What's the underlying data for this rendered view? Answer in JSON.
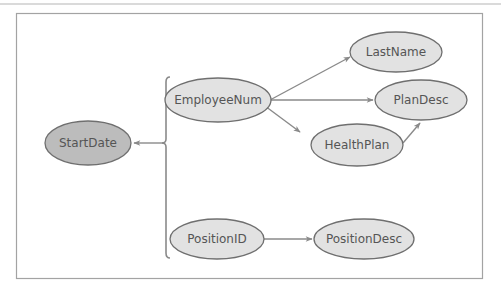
{
  "diagram": {
    "type": "functional-dependency-diagram",
    "colors": {
      "frame": "#9a9a9a",
      "node_fill": "#e2e2e2",
      "node_fill_root": "#bcbcbc",
      "node_stroke": "#6f6f6f",
      "edge": "#8a8a8a",
      "text": "#555555"
    },
    "nodes": [
      {
        "id": "startdate",
        "label": "StartDate",
        "cx": 88,
        "cy": 143,
        "rx": 43,
        "ry": 22,
        "root": true
      },
      {
        "id": "employeenum",
        "label": "EmployeeNum",
        "cx": 218,
        "cy": 100,
        "rx": 53,
        "ry": 22,
        "root": false
      },
      {
        "id": "lastname",
        "label": "LastName",
        "cx": 396,
        "cy": 52,
        "rx": 46,
        "ry": 20,
        "root": false
      },
      {
        "id": "plandesc",
        "label": "PlanDesc",
        "cx": 421,
        "cy": 100,
        "rx": 46,
        "ry": 20,
        "root": false
      },
      {
        "id": "healthplan",
        "label": "HealthPlan",
        "cx": 357,
        "cy": 145,
        "rx": 46,
        "ry": 21,
        "root": false
      },
      {
        "id": "positionid",
        "label": "PositionID",
        "cx": 217,
        "cy": 239,
        "rx": 47,
        "ry": 20,
        "root": false
      },
      {
        "id": "positiondesc",
        "label": "PositionDesc",
        "cx": 364,
        "cy": 239,
        "rx": 50,
        "ry": 20,
        "root": false
      }
    ],
    "edges": [
      {
        "from": "EmployeeNum",
        "to": "LastName"
      },
      {
        "from": "EmployeeNum",
        "to": "PlanDesc"
      },
      {
        "from": "EmployeeNum",
        "to": "HealthPlan"
      },
      {
        "from": "HealthPlan",
        "to": "PlanDesc"
      },
      {
        "from": "PositionID",
        "to": "PositionDesc"
      },
      {
        "from": "[EmployeeNum, PositionID]",
        "to": "StartDate"
      }
    ],
    "bracket_group": [
      "EmployeeNum",
      "PositionID"
    ]
  }
}
